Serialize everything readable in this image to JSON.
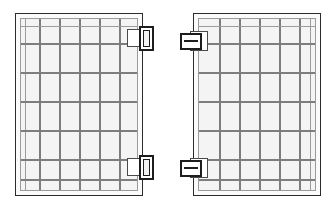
{
  "figure": {
    "kind": "technical-line-drawing",
    "width": 336,
    "height": 210,
    "background_color": "#ffffff",
    "stroke_color": "#2b2b2b",
    "grid_line_color": "#7d7d7d",
    "fill_color": "#f4f4f4",
    "stipple_color": "#9a9a9a",
    "latch_color": "#1d1d1d"
  },
  "panels": [
    {
      "id": "left-panel",
      "label": "Left panel",
      "x": 15,
      "y": 13,
      "width": 128,
      "height": 183,
      "columns": 6,
      "rows": 6,
      "border_inset": 6,
      "latch_side": "right",
      "latch_orientation": "vertical-slot",
      "column_offsets": [
        20,
        40,
        60,
        80,
        100
      ],
      "row_offsets": [
        28,
        56,
        84,
        112,
        140,
        166
      ]
    },
    {
      "id": "right-panel",
      "label": "Right panel",
      "x": 193,
      "y": 13,
      "width": 128,
      "height": 183,
      "columns": 6,
      "rows": 6,
      "border_inset": 6,
      "latch_side": "left",
      "latch_orientation": "horizontal-bar",
      "column_offsets": [
        20,
        40,
        60,
        80,
        100
      ],
      "row_offsets": [
        28,
        56,
        84,
        112,
        140,
        166
      ]
    }
  ],
  "latches": [
    {
      "id": "latch-left-top",
      "panel": "left-panel",
      "position": "top-right",
      "x": 131,
      "y": 28,
      "width": 19,
      "height": 22,
      "style": "vertical-slot"
    },
    {
      "id": "latch-left-bottom",
      "panel": "left-panel",
      "position": "bottom-right",
      "x": 131,
      "y": 157,
      "width": 19,
      "height": 22,
      "style": "vertical-slot"
    },
    {
      "id": "latch-right-top",
      "panel": "right-panel",
      "position": "top-left",
      "x": 179,
      "y": 33,
      "width": 22,
      "height": 18,
      "style": "horizontal-bar"
    },
    {
      "id": "latch-right-bottom",
      "panel": "right-panel",
      "position": "bottom-left",
      "x": 179,
      "y": 160,
      "width": 22,
      "height": 18,
      "style": "horizontal-bar"
    }
  ]
}
